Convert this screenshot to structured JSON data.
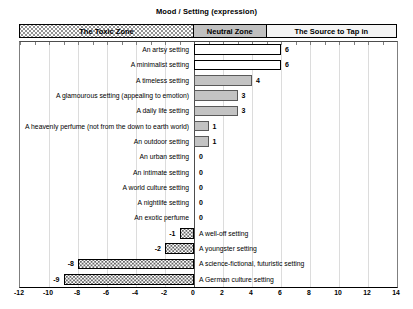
{
  "chart_data": {
    "type": "bar",
    "orientation": "horizontal",
    "title": "Mood / Setting (expression)",
    "xlim": [
      -12,
      14
    ],
    "x_ticks": [
      -12,
      -10,
      -8,
      -6,
      -4,
      -2,
      0,
      2,
      4,
      6,
      8,
      10,
      12,
      14
    ],
    "grid": true,
    "zones": [
      {
        "label": "The Toxic Zone",
        "from": -12,
        "to": 0,
        "style": "dots"
      },
      {
        "label": "Neutral Zone",
        "from": 0,
        "to": 5,
        "style": "neutral"
      },
      {
        "label": "The Source to Tap in",
        "from": 5,
        "to": 14,
        "style": "source"
      }
    ],
    "categories": [
      "An artsy setting",
      "A minimalist setting",
      "A timeless setting",
      "A glamourous setting (appealing to emotion)",
      "A daily life setting",
      "A heavenly perfume (not from the down to earth world)",
      "An outdoor setting",
      "An urban setting",
      "An intimate setting",
      "A world culture setting",
      "A nightlife setting",
      "An exotic perfume",
      "A well-off setting",
      "A youngster setting",
      "A science-fictional, futuristic setting",
      "A German culture setting"
    ],
    "values": [
      6,
      6,
      4,
      3,
      3,
      1,
      1,
      0,
      0,
      0,
      0,
      0,
      -1,
      -2,
      -8,
      -9
    ],
    "bar_styles": [
      "source",
      "source",
      "neutral",
      "neutral",
      "neutral",
      "neutral",
      "neutral",
      "none",
      "none",
      "none",
      "none",
      "none",
      "toxic",
      "toxic",
      "toxic",
      "toxic"
    ],
    "colors": {
      "neutral_fill": "#c3c3c3",
      "neutral_zone_fill": "#c0c0c0",
      "source_zone_fill": "#f4f4f4",
      "bar_border": "#000000",
      "gridline": "#dcdcdc"
    }
  }
}
